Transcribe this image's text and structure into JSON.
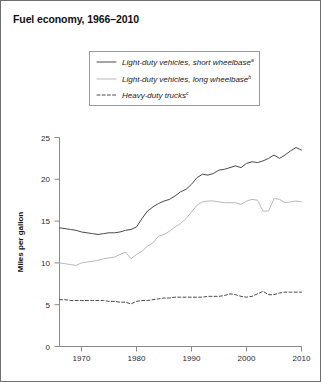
{
  "chart_data": {
    "type": "line",
    "title": "Fuel economy, 1966–2010",
    "xlabel": "",
    "ylabel": "Miles per gallon",
    "xlim": [
      1966,
      2010
    ],
    "ylim": [
      0,
      25
    ],
    "xticks": [
      1970,
      1980,
      1990,
      2000,
      2010
    ],
    "yticks": [
      0,
      5,
      10,
      15,
      20,
      25
    ],
    "grid": false,
    "legend_position": "top-center",
    "x": [
      1966,
      1967,
      1968,
      1969,
      1970,
      1971,
      1972,
      1973,
      1974,
      1975,
      1976,
      1977,
      1978,
      1979,
      1980,
      1981,
      1982,
      1983,
      1984,
      1985,
      1986,
      1987,
      1988,
      1989,
      1990,
      1991,
      1992,
      1993,
      1994,
      1995,
      1996,
      1997,
      1998,
      1999,
      2000,
      2001,
      2002,
      2003,
      2004,
      2005,
      2006,
      2007,
      2008,
      2009,
      2010
    ],
    "series": [
      {
        "name": "Light-duty vehicles, short wheelbase",
        "footnote": "a",
        "style": "solid",
        "color": "#4a4a4a",
        "values": [
          14.2,
          14.1,
          14.0,
          13.9,
          13.7,
          13.6,
          13.5,
          13.4,
          13.5,
          13.6,
          13.6,
          13.7,
          13.9,
          14.0,
          14.3,
          15.3,
          16.2,
          16.7,
          17.1,
          17.4,
          17.6,
          18.0,
          18.5,
          18.8,
          19.4,
          20.2,
          20.6,
          20.5,
          20.7,
          21.1,
          21.2,
          21.4,
          21.6,
          21.4,
          21.9,
          22.1,
          22.0,
          22.2,
          22.5,
          22.9,
          22.5,
          22.9,
          23.4,
          23.8,
          23.5
        ]
      },
      {
        "name": "Light-duty vehicles, long wheelbase",
        "footnote": "b",
        "style": "solid",
        "color": "#b9b9b9",
        "values": [
          10.0,
          9.9,
          9.8,
          9.7,
          10.0,
          10.1,
          10.2,
          10.3,
          10.5,
          10.6,
          10.7,
          11.0,
          11.3,
          10.5,
          11.0,
          11.4,
          12.0,
          12.4,
          13.2,
          13.4,
          13.8,
          14.3,
          14.7,
          15.3,
          16.1,
          16.9,
          17.3,
          17.4,
          17.4,
          17.3,
          17.2,
          17.2,
          17.2,
          17.0,
          17.4,
          17.6,
          17.5,
          16.2,
          16.2,
          17.7,
          17.6,
          17.2,
          17.3,
          17.4,
          17.3
        ]
      },
      {
        "name": "Heavy-duty trucks",
        "footnote": "c",
        "style": "dashed",
        "color": "#4a4a4a",
        "values": [
          5.6,
          5.6,
          5.5,
          5.5,
          5.5,
          5.5,
          5.5,
          5.5,
          5.5,
          5.4,
          5.4,
          5.3,
          5.3,
          5.1,
          5.4,
          5.5,
          5.5,
          5.6,
          5.7,
          5.8,
          5.8,
          5.9,
          5.9,
          5.9,
          5.9,
          5.9,
          5.9,
          6.0,
          6.0,
          6.0,
          6.1,
          6.3,
          6.2,
          6.0,
          5.9,
          6.0,
          6.3,
          6.6,
          6.2,
          6.2,
          6.4,
          6.5,
          6.5,
          6.5,
          6.5
        ]
      }
    ]
  },
  "legend": {
    "items": [
      {
        "label": "Light-duty vehicles, short wheelbase",
        "footnote": "a"
      },
      {
        "label": "Light-duty vehicles, long wheelbase",
        "footnote": "b"
      },
      {
        "label": "Heavy-duty trucks",
        "footnote": "c"
      }
    ]
  },
  "colors": {
    "frame": "#6e6e6e",
    "axis": "#8a8a8a",
    "text": "#1a1a1a",
    "series_dark": "#4a4a4a",
    "series_light": "#b9b9b9"
  }
}
